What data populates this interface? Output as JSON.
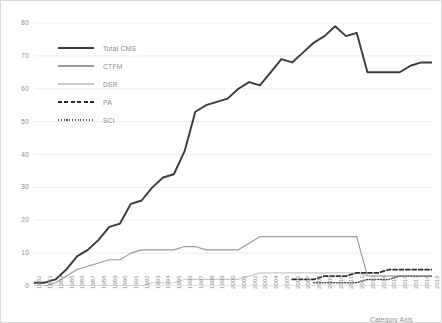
{
  "chart_data": {
    "type": "line",
    "title": "",
    "xlabel": "Category Axis",
    "ylabel": "",
    "ylim": [
      0,
      80
    ],
    "yticks": [
      0,
      10,
      20,
      30,
      40,
      50,
      60,
      70,
      80
    ],
    "grid": true,
    "legend_position": "top-left inside plot",
    "categories": [
      "1982",
      "1983",
      "1984",
      "1985",
      "1986",
      "1987",
      "1988",
      "1989",
      "1990",
      "1991",
      "1992",
      "1993",
      "1994",
      "1995",
      "1996",
      "1997",
      "1998",
      "1999",
      "2000",
      "2001",
      "2002",
      "2003",
      "2004",
      "2005",
      "2006",
      "2007",
      "2008",
      "2009",
      "2010",
      "2011",
      "2012",
      "2013",
      "2014",
      "2015",
      "2016",
      "2017",
      "2018",
      "2019"
    ],
    "series": [
      {
        "name": "Total CMS",
        "style": "solid-thick",
        "color": "#3a3a3a",
        "values": [
          1,
          1,
          2,
          5,
          9,
          11,
          14,
          18,
          19,
          25,
          26,
          30,
          33,
          34,
          41,
          53,
          55,
          56,
          57,
          60,
          62,
          61,
          65,
          69,
          68,
          71,
          74,
          76,
          79,
          76,
          77,
          65,
          65,
          65,
          65,
          67,
          68,
          68
        ]
      },
      {
        "name": "CTFM",
        "style": "solid-medium",
        "color": "#9a9a9a",
        "values": [
          0,
          0,
          1,
          3,
          5,
          6,
          7,
          8,
          8,
          10,
          11,
          11,
          11,
          11,
          12,
          12,
          11,
          11,
          11,
          11,
          13,
          15,
          15,
          15,
          15,
          15,
          15,
          15,
          15,
          15,
          15,
          3,
          3,
          3,
          3,
          3,
          3,
          3
        ]
      },
      {
        "name": "DSR",
        "style": "solid-light",
        "color": "#cacaca",
        "values": [
          0,
          0,
          0,
          0,
          0,
          0,
          0,
          0,
          0,
          0,
          0,
          1,
          1,
          1,
          2,
          2,
          2,
          2,
          2,
          2,
          3,
          4,
          4,
          4,
          4,
          4,
          4,
          4,
          4,
          4,
          4,
          3,
          3,
          3,
          3,
          3,
          3,
          3
        ]
      },
      {
        "name": "PA",
        "style": "dashed",
        "color": "#2b2b2b",
        "values": [
          null,
          null,
          null,
          null,
          null,
          null,
          null,
          null,
          null,
          null,
          null,
          null,
          null,
          null,
          null,
          null,
          null,
          null,
          null,
          null,
          null,
          null,
          null,
          null,
          2,
          2,
          2,
          3,
          3,
          3,
          4,
          4,
          4,
          5,
          5,
          5,
          5,
          5
        ]
      },
      {
        "name": "SCI",
        "style": "dotted",
        "color": "#555555",
        "values": [
          null,
          null,
          null,
          null,
          null,
          null,
          null,
          null,
          null,
          null,
          null,
          null,
          null,
          null,
          null,
          null,
          null,
          null,
          null,
          null,
          null,
          null,
          null,
          null,
          null,
          null,
          1,
          1,
          1,
          1,
          1,
          2,
          2,
          2,
          3,
          3,
          3,
          3
        ]
      }
    ]
  },
  "legend": {
    "items": [
      {
        "label": "Total CMS"
      },
      {
        "label": "CTFM"
      },
      {
        "label": "DSR"
      },
      {
        "label": "PA"
      },
      {
        "label": "SCI"
      }
    ]
  }
}
